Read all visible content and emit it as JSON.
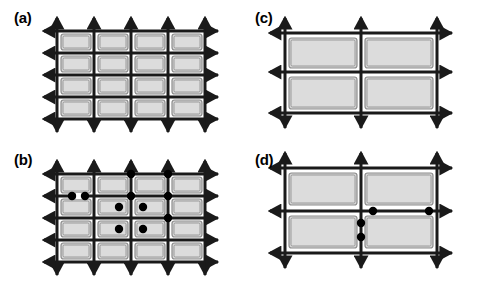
{
  "figure": {
    "type": "diagram",
    "background_color": "#ffffff",
    "width": 482,
    "height": 286
  },
  "style": {
    "rect_fill": "#d4d4d4",
    "rect_inner_fill": "#dcdcdc",
    "rect_stroke": "#8c8c8c",
    "line_color": "#1a1a1a",
    "dot_color": "#000000",
    "label_color": "#000000",
    "line_width": 3,
    "dot_radius": 4.2
  },
  "panels": [
    {
      "id": "a",
      "label": "(a)",
      "label_x": 14,
      "label_y": 10,
      "origin_x": 0,
      "origin_y": 0,
      "grid": {
        "columns": 4,
        "rows": 4,
        "cells": 16
      },
      "v_lines": [
        57,
        94,
        131,
        168,
        205
      ],
      "h_lines": [
        31,
        53,
        75,
        97,
        119
      ],
      "arrow_extent": 13,
      "rects": [
        {
          "x": 61,
          "y": 34,
          "w": 30,
          "h": 16
        },
        {
          "x": 98,
          "y": 34,
          "w": 30,
          "h": 16
        },
        {
          "x": 135,
          "y": 34,
          "w": 30,
          "h": 16
        },
        {
          "x": 172,
          "y": 34,
          "w": 30,
          "h": 16
        },
        {
          "x": 61,
          "y": 56,
          "w": 30,
          "h": 16
        },
        {
          "x": 98,
          "y": 56,
          "w": 30,
          "h": 16
        },
        {
          "x": 135,
          "y": 56,
          "w": 30,
          "h": 16
        },
        {
          "x": 172,
          "y": 56,
          "w": 30,
          "h": 16
        },
        {
          "x": 61,
          "y": 78,
          "w": 30,
          "h": 16
        },
        {
          "x": 98,
          "y": 78,
          "w": 30,
          "h": 16
        },
        {
          "x": 135,
          "y": 78,
          "w": 30,
          "h": 16
        },
        {
          "x": 172,
          "y": 78,
          "w": 30,
          "h": 16
        },
        {
          "x": 61,
          "y": 100,
          "w": 30,
          "h": 16
        },
        {
          "x": 98,
          "y": 100,
          "w": 30,
          "h": 16
        },
        {
          "x": 135,
          "y": 100,
          "w": 30,
          "h": 16
        },
        {
          "x": 172,
          "y": 100,
          "w": 30,
          "h": 16
        }
      ],
      "dots": []
    },
    {
      "id": "b",
      "label": "(b)",
      "label_x": 14,
      "label_y": 152,
      "origin_x": 0,
      "origin_y": 143,
      "grid": {
        "columns": 4,
        "rows": 4,
        "cells": 16
      },
      "v_lines": [
        57,
        94,
        131,
        168,
        205
      ],
      "h_lines": [
        31,
        53,
        75,
        97,
        119
      ],
      "arrow_extent": 13,
      "rects": [
        {
          "x": 61,
          "y": 34,
          "w": 30,
          "h": 16
        },
        {
          "x": 98,
          "y": 34,
          "w": 30,
          "h": 16
        },
        {
          "x": 135,
          "y": 34,
          "w": 30,
          "h": 16
        },
        {
          "x": 172,
          "y": 34,
          "w": 30,
          "h": 16
        },
        {
          "x": 61,
          "y": 56,
          "w": 30,
          "h": 16
        },
        {
          "x": 98,
          "y": 56,
          "w": 30,
          "h": 16
        },
        {
          "x": 135,
          "y": 56,
          "w": 30,
          "h": 16
        },
        {
          "x": 172,
          "y": 56,
          "w": 30,
          "h": 16
        },
        {
          "x": 61,
          "y": 78,
          "w": 30,
          "h": 16
        },
        {
          "x": 98,
          "y": 78,
          "w": 30,
          "h": 16
        },
        {
          "x": 135,
          "y": 78,
          "w": 30,
          "h": 16
        },
        {
          "x": 172,
          "y": 78,
          "w": 30,
          "h": 16
        },
        {
          "x": 61,
          "y": 100,
          "w": 30,
          "h": 16
        },
        {
          "x": 98,
          "y": 100,
          "w": 30,
          "h": 16
        },
        {
          "x": 135,
          "y": 100,
          "w": 30,
          "h": 16
        },
        {
          "x": 172,
          "y": 100,
          "w": 30,
          "h": 16
        }
      ],
      "dot_count": 10,
      "dots": [
        {
          "x": 72,
          "y": 53
        },
        {
          "x": 85,
          "y": 53
        },
        {
          "x": 131,
          "y": 31
        },
        {
          "x": 168,
          "y": 31
        },
        {
          "x": 131,
          "y": 53
        },
        {
          "x": 168,
          "y": 53
        },
        {
          "x": 119,
          "y": 64
        },
        {
          "x": 143,
          "y": 64
        },
        {
          "x": 168,
          "y": 75
        },
        {
          "x": 119,
          "y": 86
        },
        {
          "x": 143,
          "y": 86
        }
      ],
      "white_gaps": [
        {
          "x": 76,
          "y": 50,
          "w": 7,
          "h": 6
        },
        {
          "x": 128,
          "y": 28,
          "w": 6,
          "h": 6
        },
        {
          "x": 165,
          "y": 28,
          "w": 6,
          "h": 6
        }
      ]
    },
    {
      "id": "c",
      "label": "(c)",
      "label_x": 255,
      "label_y": 10,
      "origin_x": 241,
      "origin_y": 0,
      "grid": {
        "columns": 2,
        "rows": 2,
        "cells": 4
      },
      "v_lines": [
        44,
        120,
        196
      ],
      "h_lines": [
        33,
        72,
        113
      ],
      "arrow_extent": 15,
      "rects": [
        {
          "x": 48,
          "y": 38,
          "w": 68,
          "h": 30
        },
        {
          "x": 124,
          "y": 38,
          "w": 68,
          "h": 30
        },
        {
          "x": 48,
          "y": 77,
          "w": 68,
          "h": 32
        },
        {
          "x": 124,
          "y": 77,
          "w": 68,
          "h": 32
        }
      ],
      "dots": []
    },
    {
      "id": "d",
      "label": "(d)",
      "label_x": 255,
      "label_y": 152,
      "origin_x": 241,
      "origin_y": 143,
      "grid": {
        "columns": 2,
        "rows": 2,
        "cells": 4
      },
      "v_lines": [
        44,
        120,
        196
      ],
      "h_lines": [
        25,
        68,
        110
      ],
      "arrow_extent": 15,
      "rects": [
        {
          "x": 48,
          "y": 30,
          "w": 68,
          "h": 32
        },
        {
          "x": 124,
          "y": 30,
          "w": 68,
          "h": 32
        },
        {
          "x": 48,
          "y": 73,
          "w": 68,
          "h": 32
        },
        {
          "x": 124,
          "y": 73,
          "w": 68,
          "h": 32
        }
      ],
      "dot_count": 4,
      "dots": [
        {
          "x": 132,
          "y": 68
        },
        {
          "x": 188,
          "y": 68
        },
        {
          "x": 120,
          "y": 80
        },
        {
          "x": 120,
          "y": 94
        }
      ]
    }
  ]
}
